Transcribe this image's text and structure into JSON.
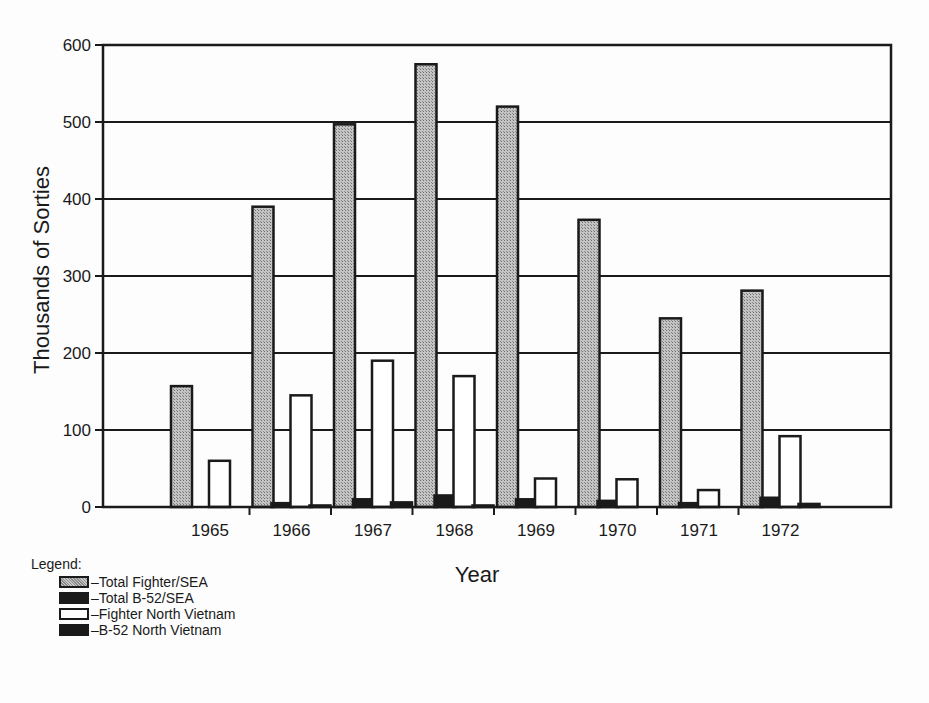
{
  "chart_data": {
    "type": "bar",
    "title": "",
    "xlabel": "Year",
    "ylabel": "Thousands of Sorties",
    "ylim": [
      0,
      600
    ],
    "yticks": [
      0,
      100,
      200,
      300,
      400,
      500,
      600
    ],
    "grid": true,
    "legend_position": "bottom-left",
    "categories": [
      "1965",
      "1966",
      "1967",
      "1968",
      "1969",
      "1970",
      "1971",
      "1972"
    ],
    "series": [
      {
        "name": "Total Fighter/SEA",
        "pattern": "hatched-gray",
        "values": [
          157,
          390,
          497,
          575,
          520,
          373,
          245,
          281
        ]
      },
      {
        "name": "Total B-52/SEA",
        "pattern": "black",
        "values": [
          0,
          5,
          10,
          15,
          10,
          8,
          5,
          12
        ]
      },
      {
        "name": "Fighter North Vietnam",
        "pattern": "white",
        "values": [
          60,
          145,
          190,
          170,
          37,
          36,
          22,
          92
        ]
      },
      {
        "name": "B-52 North Vietnam",
        "pattern": "black",
        "values": [
          0,
          2,
          6,
          2,
          0,
          0,
          0,
          4
        ]
      }
    ]
  },
  "legend": {
    "title": "Legend:",
    "items": [
      {
        "label": "–Total Fighter/SEA",
        "swatch": "hatch"
      },
      {
        "label": "–Total B-52/SEA",
        "swatch": "black"
      },
      {
        "label": "–Fighter North Vietnam",
        "swatch": "white"
      },
      {
        "label": "–B-52 North Vietnam",
        "swatch": "black"
      }
    ]
  },
  "colors": {
    "ink": "#1a1a1a",
    "hatch_dark": "#8a8a8a",
    "hatch_light": "#c8c8c8",
    "background": "#fdfdfd"
  }
}
